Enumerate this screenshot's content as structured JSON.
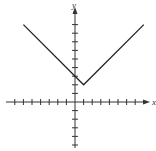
{
  "chart_data": {
    "type": "line",
    "title": "",
    "xlabel": "x",
    "ylabel": "y",
    "xlim": [
      -7,
      7
    ],
    "ylim": [
      -5,
      10
    ],
    "grid": false,
    "series": [
      {
        "name": "y = |x - 1| + 2",
        "x": [
          -6,
          1,
          8
        ],
        "y": [
          9,
          2,
          9
        ]
      }
    ],
    "colors": {
      "line": "#222222",
      "axis": "#333333"
    }
  }
}
